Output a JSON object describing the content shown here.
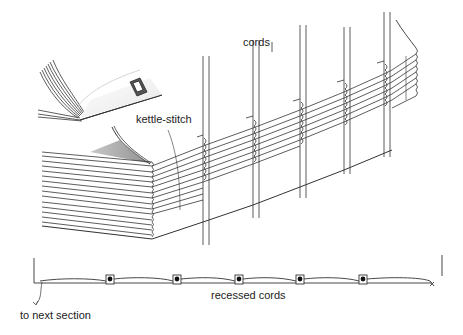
{
  "diagram": {
    "labels": {
      "cords": "cords",
      "kettle_stitch": "kettle-stitch",
      "recessed_cords": "recessed cords",
      "to_next_section": "to next section"
    },
    "cords": [
      {
        "x": 203,
        "top": 56,
        "bottom": 245
      },
      {
        "x": 253,
        "top": 40,
        "bottom": 218
      },
      {
        "x": 300,
        "top": 25,
        "bottom": 198
      },
      {
        "x": 344,
        "top": 12,
        "bottom": 174
      },
      {
        "x": 384,
        "top": 12,
        "bottom": 157
      }
    ],
    "cross_section": {
      "recessed_cord_count": 5,
      "recess_x": [
        106,
        173,
        235,
        300,
        363
      ]
    },
    "colors": {
      "line": "#333333",
      "shade": "#9a9a9a",
      "paper": "#ffffff"
    }
  }
}
